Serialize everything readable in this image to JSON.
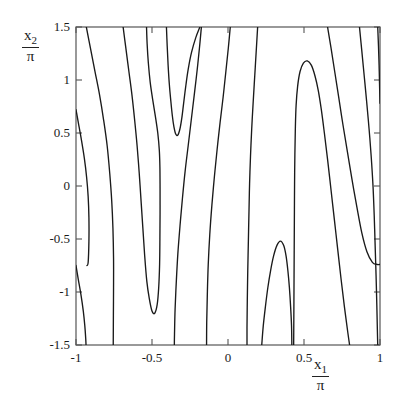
{
  "figure": {
    "kind": "contour-plot",
    "background_color": "#ffffff",
    "line_color": "#1a1a1a",
    "frame_color": "#555555",
    "width": 405,
    "height": 411
  },
  "axes": {
    "x_label_numerator": "x",
    "x_label_subscript": "1",
    "x_label_denominator": "π",
    "y_label_numerator": "x",
    "y_label_subscript": "2",
    "y_label_denominator": "π",
    "x_ticks": [
      "-1",
      "-0.5",
      "0",
      "0.5",
      "1"
    ],
    "y_ticks": [
      "1.5",
      "1",
      "0.5",
      "0",
      "-0.5",
      "-1",
      "-1.5"
    ]
  },
  "chart_data": {
    "type": "line",
    "subtype": "contour",
    "title": "",
    "xlabel": "x1/π",
    "ylabel": "x2/π",
    "xlim": [
      -1,
      1
    ],
    "ylim": [
      -1.5,
      1.5
    ],
    "xticks": [
      -1,
      -0.5,
      0,
      0.5,
      1
    ],
    "yticks": [
      1.5,
      1,
      0.5,
      0,
      -0.5,
      -1,
      -1.5
    ],
    "grid": false,
    "legend": null,
    "n_contours": 9,
    "series": [
      {
        "name": "contour-left-upper-tangent",
        "comment": "enters left edge at y=0.72, sweeps down-right and exits bottom at x=-0.92",
        "points": [
          [
            -1.0,
            0.72
          ],
          [
            -0.985,
            0.6
          ],
          [
            -0.965,
            0.44
          ],
          [
            -0.945,
            0.26
          ],
          [
            -0.93,
            0.08
          ],
          [
            -0.92,
            -0.1
          ],
          [
            -0.915,
            -0.3
          ],
          [
            -0.915,
            -0.52
          ],
          [
            -0.92,
            -0.72
          ],
          [
            -0.928,
            -0.75
          ]
        ]
      },
      {
        "name": "contour-left-lower-tangent",
        "comment": "enters left edge at y=-0.75, continues down and exits bottom edge at x=-0.92",
        "points": [
          [
            -1.0,
            -0.75
          ],
          [
            -0.985,
            -0.88
          ],
          [
            -0.968,
            -1.02
          ],
          [
            -0.952,
            -1.18
          ],
          [
            -0.942,
            -1.32
          ],
          [
            -0.936,
            -1.44
          ],
          [
            -0.934,
            -1.5
          ]
        ]
      },
      {
        "name": "contour-sweep-1",
        "comment": "from top edge x=-0.93 descending to bottom edge x=-0.755",
        "points": [
          [
            -0.932,
            1.5
          ],
          [
            -0.905,
            1.3
          ],
          [
            -0.875,
            1.08
          ],
          [
            -0.845,
            0.86
          ],
          [
            -0.818,
            0.62
          ],
          [
            -0.795,
            0.38
          ],
          [
            -0.778,
            0.12
          ],
          [
            -0.765,
            -0.14
          ],
          [
            -0.757,
            -0.4
          ],
          [
            -0.753,
            -0.68
          ],
          [
            -0.753,
            -0.96
          ],
          [
            -0.754,
            -1.22
          ],
          [
            -0.755,
            -1.5
          ]
        ]
      },
      {
        "name": "contour-narrow-loop-left",
        "comment": "long narrow closed-ish loop: descends from top at x=-0.69, bottoms at (-0.50,-1.20), rises to a near-vertical right branch that reaches up to y=1.5 near x=-0.40",
        "points": [
          [
            -0.69,
            1.5
          ],
          [
            -0.672,
            1.3
          ],
          [
            -0.652,
            1.08
          ],
          [
            -0.632,
            0.86
          ],
          [
            -0.614,
            0.62
          ],
          [
            -0.598,
            0.38
          ],
          [
            -0.584,
            0.12
          ],
          [
            -0.572,
            -0.14
          ],
          [
            -0.56,
            -0.4
          ],
          [
            -0.548,
            -0.66
          ],
          [
            -0.534,
            -0.9
          ],
          [
            -0.518,
            -1.06
          ],
          [
            -0.5,
            -1.18
          ],
          [
            -0.482,
            -1.2
          ],
          [
            -0.466,
            -1.12
          ],
          [
            -0.456,
            -0.96
          ],
          [
            -0.45,
            -0.74
          ],
          [
            -0.448,
            -0.5
          ],
          [
            -0.447,
            -0.26
          ],
          [
            -0.447,
            -0.02
          ],
          [
            -0.448,
            0.18
          ],
          [
            -0.452,
            0.34
          ],
          [
            -0.462,
            0.5
          ],
          [
            -0.478,
            0.66
          ],
          [
            -0.496,
            0.82
          ],
          [
            -0.512,
            0.98
          ],
          [
            -0.524,
            1.16
          ],
          [
            -0.532,
            1.34
          ],
          [
            -0.536,
            1.5
          ]
        ]
      },
      {
        "name": "contour-upper-middle-U",
        "comment": "U opening upward, minimum at (-0.35,0.48); left branch reaches top at x=-0.40, right branch reaches top at x=-0.175",
        "points": [
          [
            -0.405,
            1.5
          ],
          [
            -0.4,
            1.32
          ],
          [
            -0.394,
            1.14
          ],
          [
            -0.386,
            0.96
          ],
          [
            -0.376,
            0.8
          ],
          [
            -0.366,
            0.66
          ],
          [
            -0.356,
            0.56
          ],
          [
            -0.344,
            0.49
          ],
          [
            -0.33,
            0.48
          ],
          [
            -0.316,
            0.54
          ],
          [
            -0.304,
            0.64
          ],
          [
            -0.292,
            0.78
          ],
          [
            -0.278,
            0.94
          ],
          [
            -0.262,
            1.1
          ],
          [
            -0.24,
            1.26
          ],
          [
            -0.212,
            1.4
          ],
          [
            -0.185,
            1.5
          ]
        ]
      },
      {
        "name": "contour-sweep-2",
        "comment": "from top edge x=-0.175 down-left to bottom edge x=-0.35",
        "points": [
          [
            -0.175,
            1.5
          ],
          [
            -0.188,
            1.3
          ],
          [
            -0.204,
            1.08
          ],
          [
            -0.222,
            0.86
          ],
          [
            -0.242,
            0.62
          ],
          [
            -0.262,
            0.38
          ],
          [
            -0.282,
            0.14
          ],
          [
            -0.3,
            -0.12
          ],
          [
            -0.316,
            -0.38
          ],
          [
            -0.33,
            -0.64
          ],
          [
            -0.34,
            -0.9
          ],
          [
            -0.348,
            -1.16
          ],
          [
            -0.352,
            -1.4
          ],
          [
            -0.353,
            -1.5
          ]
        ]
      },
      {
        "name": "contour-sweep-3",
        "comment": "from top edge x=0.015 down-left to bottom edge x=-0.14",
        "points": [
          [
            0.015,
            1.5
          ],
          [
            0.002,
            1.3
          ],
          [
            -0.014,
            1.08
          ],
          [
            -0.032,
            0.84
          ],
          [
            -0.052,
            0.6
          ],
          [
            -0.072,
            0.34
          ],
          [
            -0.09,
            0.08
          ],
          [
            -0.106,
            -0.18
          ],
          [
            -0.12,
            -0.46
          ],
          [
            -0.13,
            -0.74
          ],
          [
            -0.136,
            -1.02
          ],
          [
            -0.14,
            -1.28
          ],
          [
            -0.141,
            -1.5
          ]
        ]
      },
      {
        "name": "contour-sweep-4",
        "comment": "from top edge x=0.195 down-left to bottom edge x=0.125, steepest central curve",
        "points": [
          [
            0.195,
            1.5
          ],
          [
            0.186,
            1.28
          ],
          [
            0.176,
            1.04
          ],
          [
            0.166,
            0.8
          ],
          [
            0.156,
            0.54
          ],
          [
            0.148,
            0.28
          ],
          [
            0.142,
            0.02
          ],
          [
            0.138,
            -0.24
          ],
          [
            0.134,
            -0.52
          ],
          [
            0.13,
            -0.8
          ],
          [
            0.127,
            -1.08
          ],
          [
            0.125,
            -1.34
          ],
          [
            0.125,
            -1.5
          ]
        ]
      },
      {
        "name": "contour-right-teardrop",
        "comment": "tall inverted-U peaking at (0.54,1.18); left branch descends near-vertically at x~0.435 to the bottom edge, right branch sweeps down-right to bottom edge at x=0.80",
        "points": [
          [
            0.432,
            -1.5
          ],
          [
            0.433,
            -1.26
          ],
          [
            0.434,
            -1.0
          ],
          [
            0.435,
            -0.74
          ],
          [
            0.436,
            -0.48
          ],
          [
            0.437,
            -0.22
          ],
          [
            0.438,
            0.04
          ],
          [
            0.44,
            0.3
          ],
          [
            0.443,
            0.54
          ],
          [
            0.448,
            0.76
          ],
          [
            0.458,
            0.94
          ],
          [
            0.474,
            1.08
          ],
          [
            0.496,
            1.16
          ],
          [
            0.522,
            1.18
          ],
          [
            0.548,
            1.14
          ],
          [
            0.572,
            1.04
          ],
          [
            0.594,
            0.9
          ],
          [
            0.614,
            0.72
          ],
          [
            0.634,
            0.5
          ],
          [
            0.656,
            0.24
          ],
          [
            0.678,
            -0.04
          ],
          [
            0.7,
            -0.32
          ],
          [
            0.722,
            -0.6
          ],
          [
            0.744,
            -0.88
          ],
          [
            0.766,
            -1.14
          ],
          [
            0.788,
            -1.38
          ],
          [
            0.8,
            -1.5
          ]
        ]
      },
      {
        "name": "contour-lower-right-hook",
        "comment": "small inverted-U peaking at (0.36,-0.52); left branch drops to bottom edge at x=0.22, right branch drops near-vertically to bottom edge at x=0.42",
        "points": [
          [
            0.222,
            -1.5
          ],
          [
            0.232,
            -1.32
          ],
          [
            0.246,
            -1.14
          ],
          [
            0.262,
            -0.96
          ],
          [
            0.28,
            -0.8
          ],
          [
            0.3,
            -0.66
          ],
          [
            0.322,
            -0.56
          ],
          [
            0.345,
            -0.52
          ],
          [
            0.366,
            -0.56
          ],
          [
            0.382,
            -0.66
          ],
          [
            0.394,
            -0.8
          ],
          [
            0.404,
            -0.96
          ],
          [
            0.412,
            -1.14
          ],
          [
            0.418,
            -1.32
          ],
          [
            0.42,
            -1.5
          ]
        ]
      },
      {
        "name": "contour-sweep-5",
        "comment": "from top edge x=0.655 sweeping down-right, exits right edge at y=-0.70",
        "points": [
          [
            0.655,
            1.5
          ],
          [
            0.678,
            1.3
          ],
          [
            0.702,
            1.08
          ],
          [
            0.728,
            0.84
          ],
          [
            0.756,
            0.58
          ],
          [
            0.786,
            0.32
          ],
          [
            0.816,
            0.06
          ],
          [
            0.848,
            -0.2
          ],
          [
            0.88,
            -0.44
          ],
          [
            0.914,
            -0.62
          ],
          [
            0.95,
            -0.72
          ],
          [
            0.98,
            -0.74
          ],
          [
            1.0,
            -0.74
          ]
        ]
      },
      {
        "name": "contour-sweep-6",
        "comment": "from top edge x=0.865 down to bottom edge x=0.985",
        "points": [
          [
            0.865,
            1.5
          ],
          [
            0.88,
            1.28
          ],
          [
            0.896,
            1.04
          ],
          [
            0.912,
            0.8
          ],
          [
            0.928,
            0.54
          ],
          [
            0.942,
            0.28
          ],
          [
            0.954,
            0.0
          ],
          [
            0.962,
            -0.28
          ],
          [
            0.968,
            -0.56
          ],
          [
            0.974,
            -0.84
          ],
          [
            0.979,
            -1.12
          ],
          [
            0.983,
            -1.38
          ],
          [
            0.985,
            -1.5
          ]
        ]
      },
      {
        "name": "contour-right-edge-sliver",
        "comment": "short arc near right edge: from top edge x=0.985 curving to the right edge at y=0.78",
        "points": [
          [
            0.985,
            1.5
          ],
          [
            0.99,
            1.32
          ],
          [
            0.994,
            1.14
          ],
          [
            0.997,
            0.96
          ],
          [
            0.999,
            0.84
          ],
          [
            1.0,
            0.78
          ]
        ]
      }
    ]
  }
}
